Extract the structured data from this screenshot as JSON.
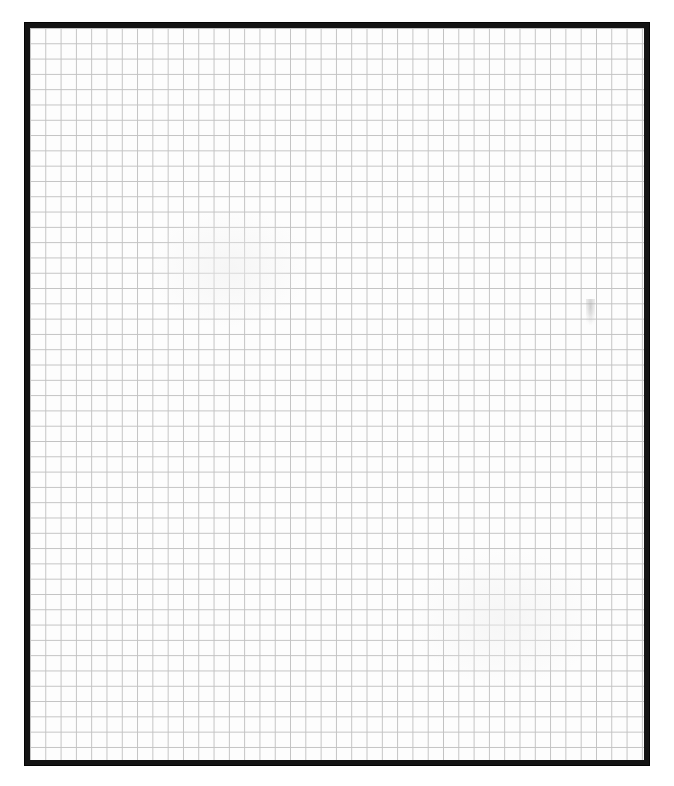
{
  "document": {
    "type": "grid-paper-sheet",
    "title": "Blank Grid Sheet",
    "content_text": "",
    "background_color": "#ffffff"
  },
  "frame": {
    "name": "border-frame",
    "color": "#141414",
    "thickness_px": 6,
    "left_px": 24,
    "top_px": 22,
    "width_px": 626,
    "height_px": 744
  },
  "grid": {
    "name": "graph-paper-grid",
    "line_color": "#c2c2c2",
    "minor_line_color": "#d8d8d8",
    "paper_color": "#fdfdfd",
    "cell_size_px": 15.3,
    "columns": 40,
    "rows": 48,
    "line_width_px": 1,
    "has_major_lines": false
  },
  "artifacts": {
    "smudge": {
      "name": "smudge-mark",
      "left_px": 586,
      "top_px": 299,
      "width_px": 9,
      "height_px": 26,
      "color": "#9a9a9a",
      "description": "faint scan smudge"
    },
    "tone_blotches": [
      {
        "left_px": 120,
        "top_px": 180,
        "width_px": 160,
        "height_px": 120
      },
      {
        "left_px": 380,
        "top_px": 520,
        "width_px": 190,
        "height_px": 140
      }
    ]
  }
}
